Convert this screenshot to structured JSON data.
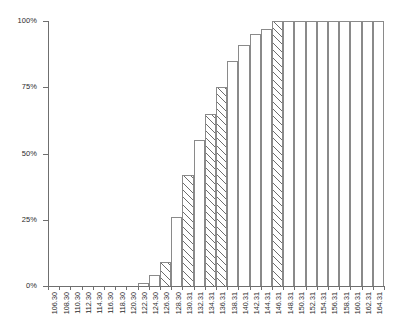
{
  "chart_data": {
    "type": "bar",
    "title": "",
    "subtitle": "",
    "xlabel": "",
    "ylabel": "",
    "ylim": [
      0,
      100
    ],
    "yticks": [
      0,
      25,
      50,
      75,
      100
    ],
    "ytick_labels": [
      "0%",
      "25%",
      "50%",
      "75%",
      "100%"
    ],
    "grid": false,
    "legend": null,
    "annotations": [],
    "categories": [
      "106.30",
      "108.30",
      "110.30",
      "112.30",
      "114.30",
      "116.30",
      "118.30",
      "120.30",
      "122.30",
      "124.30",
      "126.30",
      "128.30",
      "130.31",
      "132.31",
      "134.31",
      "136.31",
      "138.31",
      "140.31",
      "142.31",
      "144.31",
      "146.31",
      "148.31",
      "150.31",
      "152.31",
      "154.31",
      "156.31",
      "158.31",
      "160.31",
      "162.31",
      "164.31"
    ],
    "values": [
      0,
      0,
      0,
      0,
      0,
      0,
      0,
      0,
      1,
      4,
      9,
      26,
      42,
      55,
      65,
      75,
      85,
      91,
      95,
      97,
      100,
      100,
      100,
      100,
      100,
      100,
      100,
      100,
      100,
      100
    ],
    "fills": [
      "none",
      "none",
      "none",
      "none",
      "none",
      "none",
      "none",
      "none",
      "plain",
      "plain",
      "hatched",
      "plain",
      "hatched",
      "plain",
      "hatched",
      "hatched",
      "plain",
      "plain",
      "plain",
      "plain",
      "hatched",
      "plain",
      "plain",
      "plain",
      "plain",
      "plain",
      "plain",
      "plain",
      "plain",
      "plain"
    ]
  },
  "colors": {
    "axis": "#6f6f6f",
    "bar_edge": "#8a8a8a",
    "bar_fill": "#ffffff",
    "hatch": "#6d6d6d",
    "text": "#2b2b2b",
    "background": "#ffffff"
  }
}
